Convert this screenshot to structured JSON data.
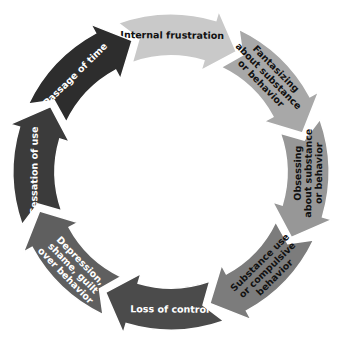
{
  "diagram": {
    "type": "cycle",
    "direction": "clockwise",
    "segments": [
      {
        "id": "internal-frustration",
        "lines": [
          "Internal frustration"
        ],
        "fill": "#c9c9c9",
        "text_color": "#111111"
      },
      {
        "id": "fantasizing",
        "lines": [
          "Fantasizing",
          "about substance",
          "or behavior"
        ],
        "fill": "#a8a8a8",
        "text_color": "#111111"
      },
      {
        "id": "obsessing",
        "lines": [
          "Obsessing",
          "about substance",
          "or behavior"
        ],
        "fill": "#979797",
        "text_color": "#111111"
      },
      {
        "id": "substance-use",
        "lines": [
          "Substance use",
          "or compulsive",
          "behavior"
        ],
        "fill": "#7c7c7c",
        "text_color": "#111111"
      },
      {
        "id": "loss-of-control",
        "lines": [
          "Loss of control"
        ],
        "fill": "#4b4b4b",
        "text_color": "#ffffff"
      },
      {
        "id": "depression",
        "lines": [
          "Depression,",
          "shame, guilt",
          "over behavior"
        ],
        "fill": "#5f5f5f",
        "text_color": "#ffffff"
      },
      {
        "id": "cessation-of-use",
        "lines": [
          "Cessation of use"
        ],
        "fill": "#3b3b3b",
        "text_color": "#ffffff"
      },
      {
        "id": "passage-of-time",
        "lines": [
          "Passage of time"
        ],
        "fill": "#2d2d2d",
        "text_color": "#ffffff"
      }
    ]
  }
}
